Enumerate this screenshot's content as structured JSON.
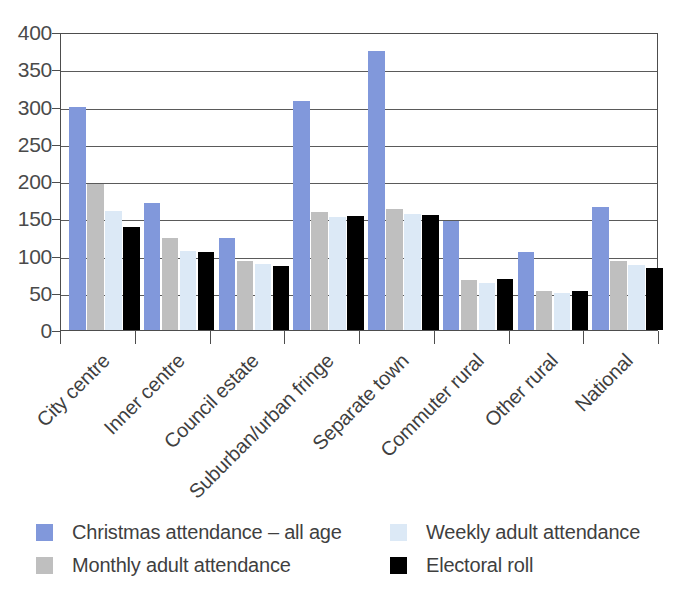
{
  "chart_data": {
    "type": "bar",
    "title": "",
    "subtitle": "",
    "xlabel": "",
    "ylabel": "",
    "ylim": [
      0,
      400
    ],
    "ytick_values": [
      0,
      50,
      100,
      150,
      200,
      250,
      300,
      350,
      400
    ],
    "ytick_labels": [
      "0",
      "50",
      "100",
      "150",
      "200",
      "250",
      "300",
      "350",
      "400"
    ],
    "grid": true,
    "legend_position": "bottom",
    "categories": [
      "City centre",
      "Inner centre",
      "Council estate",
      "Suburban/urban fringe",
      "Separate town",
      "Commuter rural",
      "Other rural",
      "National"
    ],
    "series": [
      {
        "name": "Christmas attendance – all age",
        "color": "#8198db",
        "values": [
          300,
          170,
          123,
          308,
          374,
          147,
          105,
          165
        ]
      },
      {
        "name": "Monthly adult attendance",
        "color": "#bfbfbf",
        "values": [
          196,
          123,
          93,
          158,
          162,
          67,
          53,
          92
        ]
      },
      {
        "name": "Weekly adult attendance",
        "color": "#dce9f6",
        "values": [
          160,
          106,
          88,
          152,
          156,
          63,
          50,
          87
        ]
      },
      {
        "name": "Electoral roll",
        "color": "#000000",
        "values": [
          138,
          105,
          86,
          153,
          155,
          69,
          53,
          83
        ]
      }
    ]
  },
  "legend": {
    "items": [
      {
        "label": "Christmas attendance – all age",
        "swatch": "s0"
      },
      {
        "label": "Monthly adult attendance",
        "swatch": "s1"
      },
      {
        "label": "Weekly adult attendance",
        "swatch": "s2"
      },
      {
        "label": "Electoral roll",
        "swatch": "s3"
      }
    ]
  }
}
